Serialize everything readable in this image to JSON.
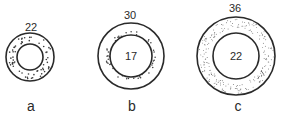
{
  "figure": {
    "stroke_color": "#2a2a2a",
    "background": "#ffffff",
    "panels": [
      {
        "id": "a",
        "letter": "a",
        "outer_label": "22",
        "inner_label": "",
        "cx": 30,
        "cy": 57,
        "r_outer": 24,
        "r_inner": 13,
        "stippling": "dense dots filling whole annulus"
      },
      {
        "id": "b",
        "letter": "b",
        "outer_label": "30",
        "inner_label": "17",
        "cx": 131,
        "cy": 56,
        "r_outer": 33,
        "r_inner": 21,
        "stippling": "ring of dots hugging inner circle"
      },
      {
        "id": "c",
        "letter": "c",
        "outer_label": "36",
        "inner_label": "22",
        "cx": 236,
        "cy": 56,
        "r_outer": 39,
        "r_inner": 23,
        "stippling": "fine dots near outer edge of annulus"
      }
    ]
  }
}
